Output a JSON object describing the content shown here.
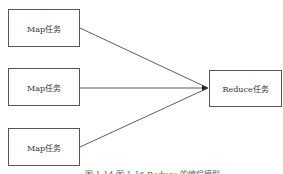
{
  "diagram": {
    "type": "flow",
    "nodes": [
      {
        "id": "map1",
        "label": "Map任务"
      },
      {
        "id": "map2",
        "label": "Map任务"
      },
      {
        "id": "map3",
        "label": "Map任务"
      },
      {
        "id": "reduce",
        "label": "Reduce任务"
      }
    ],
    "edges": [
      {
        "from": "map1",
        "to": "reduce"
      },
      {
        "from": "map2",
        "to": "reduce"
      },
      {
        "from": "map3",
        "to": "reduce"
      }
    ],
    "colors": {
      "stroke": "#333333",
      "box_border": "#555555",
      "text": "#333333"
    }
  },
  "caption": {
    "text": "图 1-14   图 1-15   Reduce 的编程模型"
  }
}
